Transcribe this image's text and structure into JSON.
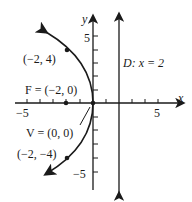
{
  "diagram": {
    "type": "parabola",
    "axes": {
      "x_label": "x",
      "y_label": "y",
      "x_ticks": {
        "neg": "−5",
        "pos": "5"
      },
      "y_ticks": {
        "pos": "5",
        "neg": "−5"
      }
    },
    "labels": {
      "point_top": "(−2, 4)",
      "focus": "F = (−2, 0)",
      "vertex": "V = (0, 0)",
      "point_bottom": "(−2, −4)",
      "directrix": "D: x = 2"
    },
    "colors": {
      "ink": "#1a1a1a",
      "background": "#ffffff"
    }
  }
}
